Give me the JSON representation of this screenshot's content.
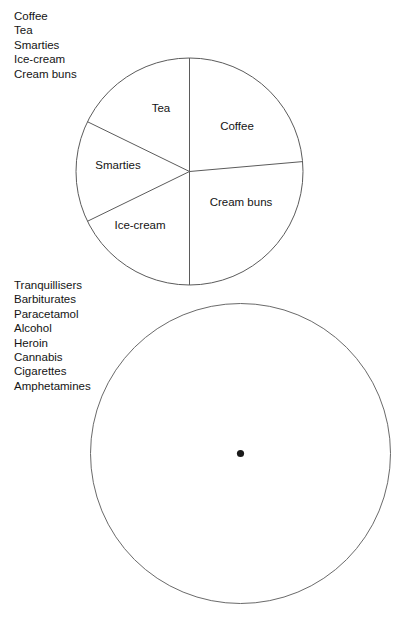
{
  "document": {
    "title": "Pie chart exercise — substance lists",
    "background_color": "#ffffff",
    "ink_color": "#141414",
    "line_color": "#5b5b5b"
  },
  "legend_foods": {
    "name": "foods-legend",
    "items": [
      {
        "label": "Coffee"
      },
      {
        "label": "Tea"
      },
      {
        "label": "Smarties"
      },
      {
        "label": "Ice-cream"
      },
      {
        "label": "Cream buns"
      }
    ]
  },
  "legend_drugs": {
    "name": "drugs-legend",
    "items": [
      {
        "label": "Tranquillisers"
      },
      {
        "label": "Barbiturates"
      },
      {
        "label": "Paracetamol"
      },
      {
        "label": "Alcohol"
      },
      {
        "label": "Heroin"
      },
      {
        "label": "Cannabis"
      },
      {
        "label": "Cigarettes"
      },
      {
        "label": "Amphetamines"
      }
    ]
  },
  "chart_data": [
    {
      "type": "pie",
      "name": "foods-pie-chart",
      "title": "",
      "subtitle": "",
      "xlabel": "",
      "ylabel": "",
      "legend_position": "top-left-external-list",
      "grid": false,
      "center": {
        "x": 189.5,
        "y": 171.5
      },
      "radius": 113.5,
      "labels": [
        "Coffee",
        "Cream buns",
        "Ice-cream",
        "Smarties",
        "Tea"
      ],
      "values": [
        25,
        32,
        21,
        33,
        49
      ],
      "units": "degrees",
      "slices": [
        {
          "label": "Coffee",
          "start_angle_deg": 0,
          "end_angle_deg": 85,
          "sweep_deg": 85,
          "percent": 23.6,
          "label_x": 237,
          "label_y": 130
        },
        {
          "label": "Cream buns",
          "start_angle_deg": 85,
          "end_angle_deg": 180,
          "sweep_deg": 95,
          "percent": 26.4,
          "label_x": 241,
          "label_y": 206
        },
        {
          "label": "Ice-cream",
          "start_angle_deg": 180,
          "end_angle_deg": 244,
          "sweep_deg": 64,
          "percent": 17.8,
          "label_x": 140,
          "label_y": 229
        },
        {
          "label": "Smarties",
          "start_angle_deg": 244,
          "end_angle_deg": 296,
          "sweep_deg": 52,
          "percent": 14.4,
          "label_x": 118,
          "label_y": 169
        },
        {
          "label": "Tea",
          "start_angle_deg": 296,
          "end_angle_deg": 360,
          "sweep_deg": 64,
          "percent": 17.8,
          "label_x": 161,
          "label_y": 112
        }
      ]
    },
    {
      "type": "pie",
      "name": "drugs-pie-chart-blank",
      "title": "",
      "subtitle": "",
      "xlabel": "",
      "ylabel": "",
      "legend_position": "top-left-external-list",
      "grid": false,
      "center": {
        "x": 240.5,
        "y": 453.5
      },
      "radius": 150,
      "labels": [],
      "values": [],
      "slices": [],
      "note": "blank circle with centre dot — no sectors drawn"
    }
  ]
}
